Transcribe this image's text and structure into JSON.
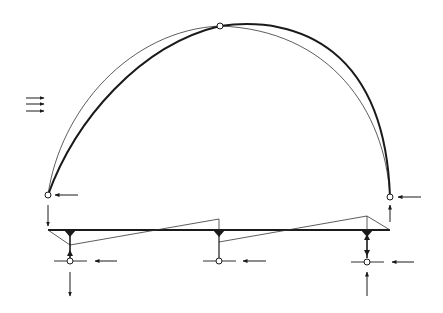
{
  "diagram": {
    "type": "structural-arch-with-tie-beam",
    "colors": {
      "background": "#ffffff",
      "line": "#1a1a1a",
      "thin": "#333333"
    },
    "hinges": [
      {
        "name": "left-arch-hinge",
        "x": 48,
        "y": 195
      },
      {
        "name": "crown-hinge",
        "x": 220,
        "y": 26
      },
      {
        "name": "right-arch-hinge",
        "x": 390,
        "y": 197
      }
    ],
    "beam": {
      "y": 230,
      "x_start": 48,
      "x_end": 390
    },
    "supports": [
      {
        "name": "support-left",
        "x": 70,
        "node_y": 261
      },
      {
        "name": "support-center",
        "x": 219,
        "node_y": 261
      },
      {
        "name": "support-right",
        "x": 367,
        "node_y": 261
      }
    ],
    "wind_arrows": {
      "count": 3,
      "x_start": 26,
      "x_end": 44,
      "ys": [
        98,
        104,
        111
      ]
    }
  }
}
